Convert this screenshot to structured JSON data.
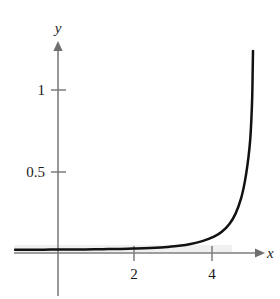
{
  "figure": {
    "background_color": "#ffffff",
    "axis_color": "#7d7d7d",
    "curve_color": "#111111",
    "tick_text_color": "#1a1a1a",
    "shade_color": "#ebebeb"
  },
  "axes": {
    "x_axis_label": "x",
    "y_axis_label": "y",
    "x_tick_labels": [
      "2",
      "4"
    ],
    "y_tick_labels": [
      "0.5",
      "1"
    ],
    "x_arrow": "arrow-right",
    "y_arrow": "arrow-up"
  },
  "chart_data": {
    "type": "line",
    "title": "",
    "subtitle": "",
    "xlabel": "x",
    "ylabel": "y",
    "xlim": [
      -1.1,
      5.6
    ],
    "ylim": [
      -0.3,
      1.25
    ],
    "grid": false,
    "legend": null,
    "x_ticks": [
      2,
      4
    ],
    "x_ticklabels": [
      "2",
      "4"
    ],
    "y_ticks": [
      0.5,
      1
    ],
    "y_ticklabels": [
      "0.5",
      "1"
    ],
    "annotations": [],
    "series": [
      {
        "name": "curve",
        "description": "Curve nearly zero for x below 4, rising steeply with a vertical asymptote near x = 5",
        "x": [
          -1.1,
          -0.8,
          -0.5,
          -0.2,
          0.1,
          0.4,
          0.7,
          1.0,
          1.3,
          1.6,
          1.9,
          2.2,
          2.5,
          2.8,
          3.1,
          3.4,
          3.7,
          4.0,
          4.2,
          4.4,
          4.55,
          4.7,
          4.8,
          4.88,
          4.93,
          4.96,
          4.98,
          4.99,
          5.0
        ],
        "y": [
          0.02,
          0.02,
          0.02,
          0.021,
          0.021,
          0.022,
          0.022,
          0.023,
          0.024,
          0.025,
          0.027,
          0.029,
          0.032,
          0.037,
          0.044,
          0.055,
          0.073,
          0.1,
          0.13,
          0.18,
          0.24,
          0.34,
          0.45,
          0.58,
          0.7,
          0.83,
          0.96,
          1.09,
          1.24
        ]
      }
    ]
  }
}
